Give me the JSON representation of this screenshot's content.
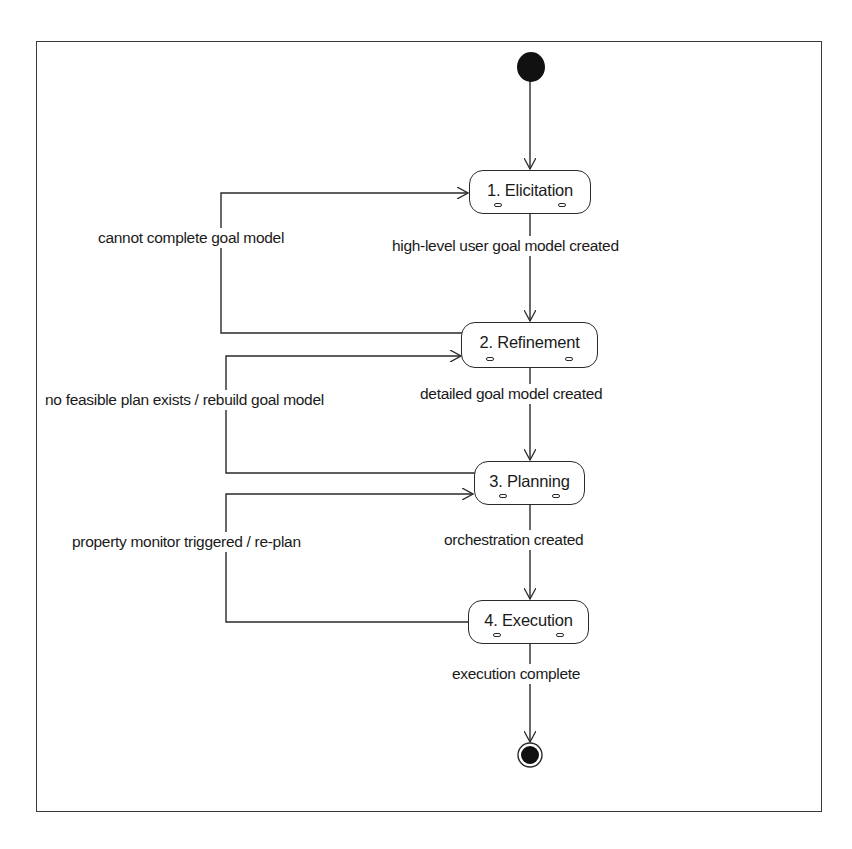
{
  "diagram": {
    "type": "UML activity/state diagram",
    "initial_node": {
      "label": "start"
    },
    "final_node": {
      "label": "end"
    },
    "states": [
      {
        "id": "elicitation",
        "label": "1. Elicitation"
      },
      {
        "id": "refinement",
        "label": "2. Refinement"
      },
      {
        "id": "planning",
        "label": "3. Planning"
      },
      {
        "id": "execution",
        "label": "4. Execution"
      }
    ],
    "transitions": [
      {
        "from": "elicitation",
        "to": "refinement",
        "label": "high-level user goal model created"
      },
      {
        "from": "refinement",
        "to": "elicitation",
        "label": "cannot complete goal model"
      },
      {
        "from": "refinement",
        "to": "planning",
        "label": "detailed goal model created"
      },
      {
        "from": "planning",
        "to": "refinement",
        "label": "no feasible plan exists / rebuild goal model"
      },
      {
        "from": "planning",
        "to": "execution",
        "label": "orchestration created"
      },
      {
        "from": "execution",
        "to": "planning",
        "label": "property monitor triggered / re-plan"
      },
      {
        "from": "execution",
        "to": "final",
        "label": "execution complete"
      }
    ],
    "colors": {
      "line": "#2a2a2a",
      "node_fill": "#111111",
      "background": "#ffffff"
    }
  }
}
